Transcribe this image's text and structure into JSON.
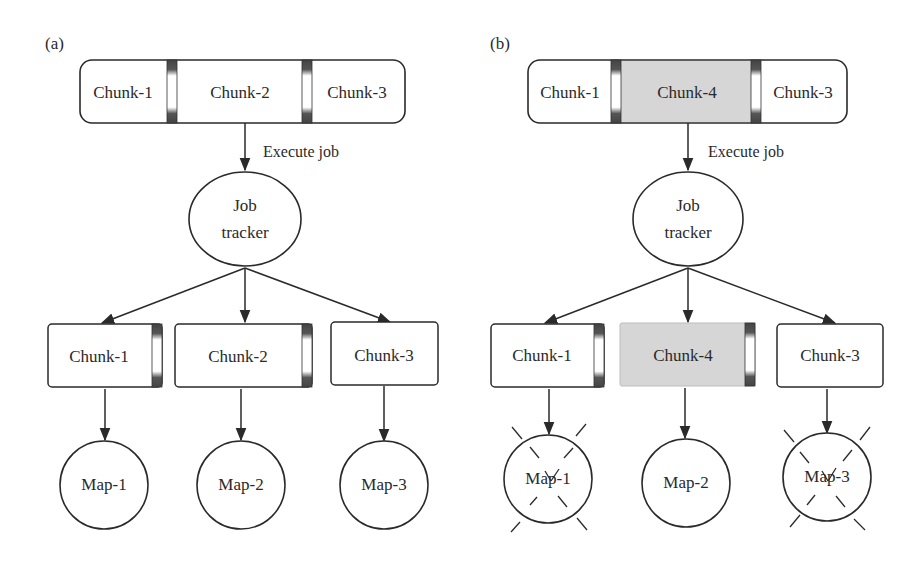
{
  "figure": {
    "panels": [
      {
        "label": "(a)",
        "top_bar": {
          "chunks": [
            {
              "label": "Chunk-1",
              "highlighted": false
            },
            {
              "label": "Chunk-2",
              "highlighted": false
            },
            {
              "label": "Chunk-3",
              "highlighted": false
            }
          ]
        },
        "edge_label": "Execute job",
        "job_tracker": {
          "line1": "Job",
          "line2": "tracker"
        },
        "chunks": [
          {
            "label": "Chunk-1",
            "highlighted": false,
            "has_separator": true
          },
          {
            "label": "Chunk-2",
            "highlighted": false,
            "has_separator": true
          },
          {
            "label": "Chunk-3",
            "highlighted": false,
            "has_separator": false
          }
        ],
        "maps": [
          {
            "label": "Map-1",
            "failed": false
          },
          {
            "label": "Map-2",
            "failed": false
          },
          {
            "label": "Map-3",
            "failed": false
          }
        ]
      },
      {
        "label": "(b)",
        "top_bar": {
          "chunks": [
            {
              "label": "Chunk-1",
              "highlighted": false
            },
            {
              "label": "Chunk-4",
              "highlighted": true
            },
            {
              "label": "Chunk-3",
              "highlighted": false
            }
          ]
        },
        "edge_label": "Execute job",
        "job_tracker": {
          "line1": "Job",
          "line2": "tracker"
        },
        "chunks": [
          {
            "label": "Chunk-1",
            "highlighted": false,
            "has_separator": true
          },
          {
            "label": "Chunk-4",
            "highlighted": true,
            "has_separator": true
          },
          {
            "label": "Chunk-3",
            "highlighted": false,
            "has_separator": false
          }
        ],
        "maps": [
          {
            "label": "Map-1",
            "failed": true
          },
          {
            "label": "Map-2",
            "failed": false
          },
          {
            "label": "Map-3",
            "failed": true
          }
        ]
      }
    ],
    "colors": {
      "stroke": "#2a2a2a",
      "highlight_fill": "#d6d6d6",
      "separator_dark": "#4a4a4a",
      "background": "#ffffff"
    }
  }
}
